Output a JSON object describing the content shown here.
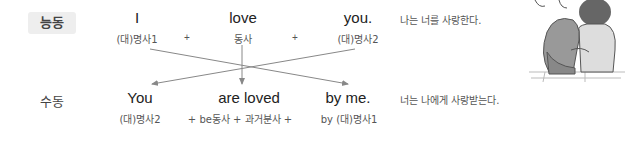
{
  "active": {
    "label": "능동",
    "words": [
      "I",
      "love",
      "you."
    ],
    "parts": [
      "(대)명사1",
      "동사",
      "(대)명사2"
    ],
    "plus": "+",
    "translation": "나는 너를 사랑한다."
  },
  "passive": {
    "label": "수동",
    "words": [
      "You",
      "are loved",
      "by me."
    ],
    "parts": [
      "(대)명사2",
      "+ be동사 + 과거분사 +",
      "by (대)명사1"
    ],
    "translation": "너는 나에게 사랑받는다."
  },
  "illustration": {
    "description": "couple-sitting-together-icon"
  },
  "colors": {
    "badge_bg": "#eeeeee",
    "arrow": "#888888",
    "text": "#222222"
  }
}
